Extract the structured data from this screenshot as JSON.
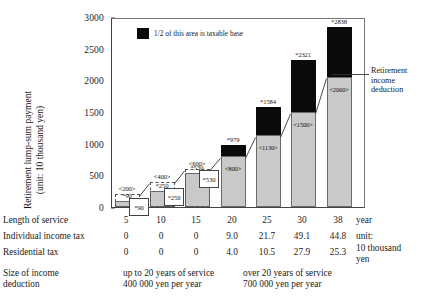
{
  "chart_data": {
    "type": "bar",
    "title": "",
    "xlabel": "Length of service",
    "ylabel": "Retirement lump-sum payment (unit: 10 thousand yen)",
    "ylim": [
      0,
      3000
    ],
    "yticks": [
      0,
      500,
      1000,
      1500,
      2000,
      2500,
      3000
    ],
    "grid": false,
    "legend_position": "inside-top-left",
    "categories": [
      "5",
      "10",
      "15",
      "20",
      "25",
      "30",
      "38"
    ],
    "series": [
      {
        "name": "Retirement income deduction",
        "color": "#c9c9c9",
        "values": [
          200,
          400,
          600,
          800,
          1130,
          1500,
          2060
        ],
        "labels": [
          "<200>",
          "<400>",
          "<600>",
          "<800>",
          "<1130>",
          "<1500>",
          "<2060>"
        ]
      },
      {
        "name": "1/2 of this area is taxable base",
        "color": "#0a0a0a",
        "values": [
          0,
          0,
          0,
          179,
          454,
          821,
          778
        ]
      }
    ],
    "totals": [
      90,
      250,
      530,
      979,
      1584,
      2321,
      2838
    ],
    "total_labels": [
      "*90",
      "*250",
      "*530",
      "*979",
      "*1584",
      "*2321",
      "*2838"
    ],
    "annotations": [
      {
        "name": "retirement-income-deduction",
        "text": "Retirement income deduction"
      },
      {
        "name": "legend-taxable-base",
        "text": "1/2 of this area is taxable base"
      }
    ]
  },
  "axis": {
    "y_title_line1": "Retirement lump-sum payment",
    "y_title_line2": "(unit: 10 thousand yen)",
    "y_ticks": [
      "3000",
      "2500",
      "2000",
      "1500",
      "1000",
      "500",
      "0"
    ]
  },
  "legend": {
    "label": "1/2 of this area is taxable base"
  },
  "annotation": {
    "deduction_line1": "Retirement",
    "deduction_line2": "income",
    "deduction_line3": "deduction"
  },
  "bars": [
    {
      "category": "5",
      "total_label": "*90",
      "deduction_label": "<200>",
      "small": true
    },
    {
      "category": "10",
      "total_label": "*250",
      "deduction_label": "<400>",
      "small": true
    },
    {
      "category": "15",
      "total_label": "*530",
      "deduction_label": "<600>",
      "small": true
    },
    {
      "category": "20",
      "total_label": "*979",
      "deduction_label": "<800>",
      "small": false
    },
    {
      "category": "25",
      "total_label": "*1584",
      "deduction_label": "<1130>",
      "small": false
    },
    {
      "category": "30",
      "total_label": "*2321",
      "deduction_label": "<1500>",
      "small": false
    },
    {
      "category": "38",
      "total_label": "*2838",
      "deduction_label": "<2060>",
      "small": false
    }
  ],
  "table": {
    "rows": [
      {
        "label": "Length of service",
        "values": [
          "5",
          "10",
          "15",
          "20",
          "25",
          "30",
          "38"
        ]
      },
      {
        "label": "Individual income tax",
        "values": [
          "0",
          "0",
          "0",
          "9.0",
          "21.7",
          "49.1",
          "44.8"
        ]
      },
      {
        "label": "Residential tax",
        "values": [
          "0",
          "0",
          "0",
          "4.0",
          "10.5",
          "27.9",
          "25.3"
        ]
      }
    ],
    "unit_year": "year",
    "unit_line1": "unit:",
    "unit_line2": "10 thousand",
    "unit_line3": "yen",
    "deduction_row_line1": "Size of income",
    "deduction_row_line2": "deduction",
    "deduction_left_line1": "up to 20 years of service",
    "deduction_left_line2": "400 000 yen per year",
    "deduction_right_line1": "over 20 years of service",
    "deduction_right_line2": "700 000 yen per year"
  }
}
